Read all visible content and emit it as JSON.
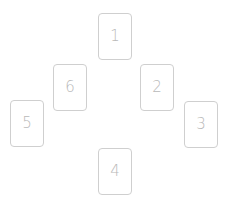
{
  "layout": {
    "background": "#ffffff",
    "border_color": "#cfcfcf",
    "text_color": "#b9b9b9"
  },
  "cards": [
    {
      "label": "1",
      "left": 98,
      "top": 13
    },
    {
      "label": "2",
      "left": 140,
      "top": 64
    },
    {
      "label": "3",
      "left": 184,
      "top": 101
    },
    {
      "label": "4",
      "left": 98,
      "top": 148
    },
    {
      "label": "5",
      "left": 10,
      "top": 100
    },
    {
      "label": "6",
      "left": 53,
      "top": 64
    }
  ]
}
